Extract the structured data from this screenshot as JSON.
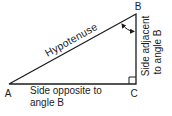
{
  "colors": {
    "background": "#ffffff",
    "line": "#1c1c1c",
    "text": "#1c1c1c"
  },
  "triangle": {
    "vertex_a": "A",
    "vertex_b": "B",
    "vertex_c": "C",
    "hypotenuse_label": "Hypotenuse",
    "opposite_label_line1": "Side opposite to",
    "opposite_label_line2": "angle B",
    "adjacent_label_line1": "Side adjacent",
    "adjacent_label_line2": "to angle B"
  }
}
